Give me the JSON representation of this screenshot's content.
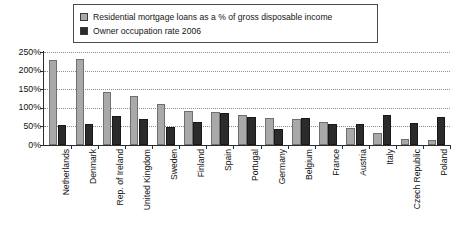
{
  "legend": {
    "items": [
      {
        "label": "Residential mortgage loans as a % of gross disposable income",
        "color": "#a9a9a9",
        "swatch_name": "legend-swatch-mortgage"
      },
      {
        "label": "Owner occupation rate 2006",
        "color": "#2b2b2b",
        "swatch_name": "legend-swatch-owner"
      }
    ]
  },
  "axis": {
    "y_ticks": [
      "250%",
      "200%",
      "150%",
      "100%",
      "50%",
      "0%"
    ]
  },
  "chart_data": {
    "type": "bar",
    "title": "",
    "subtitle": "",
    "xlabel": "",
    "ylabel": "",
    "ylim": [
      0,
      250
    ],
    "ytick_values": [
      0,
      50,
      100,
      150,
      200,
      250
    ],
    "ytick_labels": [
      "0%",
      "50%",
      "100%",
      "150%",
      "200%",
      "250%"
    ],
    "grid": true,
    "grid_axis": "y",
    "legend_position": "top",
    "categories": [
      "Netherlands",
      "Denmark",
      "Rep. of Ireland",
      "United Kingdom",
      "Sweden",
      "Finland",
      "Spain",
      "Portugal",
      "Germany",
      "Belgium",
      "France",
      "Austria",
      "Italy",
      "Czech Republic",
      "Poland"
    ],
    "series": [
      {
        "name": "Residential mortgage loans as a % of gross disposable income",
        "color": "#a9a9a9",
        "values": [
          228,
          230,
          142,
          133,
          111,
          92,
          88,
          80,
          72,
          70,
          62,
          45,
          32,
          16,
          14
        ]
      },
      {
        "name": "Owner occupation rate 2006",
        "color": "#2b2b2b",
        "values": [
          55,
          57,
          78,
          70,
          48,
          62,
          85,
          76,
          43,
          72,
          57,
          57,
          80,
          60,
          75
        ]
      }
    ]
  }
}
